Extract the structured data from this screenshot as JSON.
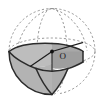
{
  "figure": {
    "type": "solid-geometry-diagram",
    "background_color": "#ffffff",
    "labels": [
      {
        "id": "center",
        "text": "O",
        "x": 59.5,
        "y": 58.5
      }
    ],
    "center_point": {
      "x": 52.0,
      "y": 51.5,
      "radius": 1.9,
      "color": "#111111"
    },
    "colors": {
      "outline": "#2b2b2b",
      "hidden_line": "#8a8a8a",
      "shade_fill": "#b3b3b3",
      "shade_fill_dark": "#a5a5a5",
      "highlight_fill": "#c2c2c2",
      "label": "#1a1a1a"
    },
    "sphere": {
      "cx": 52.0,
      "cy": 51.5,
      "rx": 43.0,
      "ry": 43.0
    },
    "equator_ellipse": {
      "cx": 52.0,
      "cy": 51.5,
      "rx": 43.0,
      "ry": 13.5
    },
    "meridian_ellipse": {
      "cx": 52.0,
      "cy": 51.5,
      "rx": 15.0,
      "ry": 43.0
    },
    "stroke_widths": {
      "outline": 1.5,
      "hidden": 0.8,
      "radius": 1.1
    },
    "dash_pattern": "2.2 2.2"
  }
}
